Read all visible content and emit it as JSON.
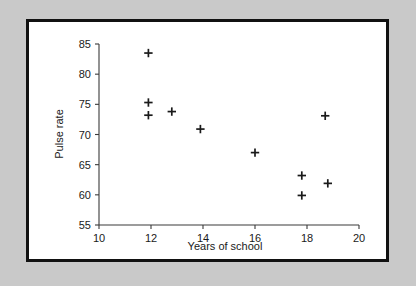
{
  "figure": {
    "background_color": "#c9c9c9",
    "card_color": "#ffffff",
    "frame_color": "#111111"
  },
  "chart_data": {
    "type": "scatter",
    "title": "",
    "xlabel": "Years of school",
    "ylabel": "Pulse rate",
    "xlim": [
      10,
      20
    ],
    "ylim": [
      55,
      85
    ],
    "xticks": [
      10,
      12,
      14,
      16,
      18,
      20
    ],
    "yticks": [
      55,
      60,
      65,
      70,
      75,
      80,
      85
    ],
    "xtick_labels": [
      "10",
      "12",
      "14",
      "16",
      "18",
      "20"
    ],
    "ytick_labels": [
      "55",
      "60",
      "65",
      "70",
      "75",
      "80",
      "85"
    ],
    "grid": false,
    "legend": false,
    "marker": "plus",
    "marker_color": "#1a1a1a",
    "points": [
      {
        "x": 11.9,
        "y": 83.5
      },
      {
        "x": 11.9,
        "y": 75.3
      },
      {
        "x": 11.9,
        "y": 73.2
      },
      {
        "x": 12.8,
        "y": 73.8
      },
      {
        "x": 13.9,
        "y": 70.9
      },
      {
        "x": 16.0,
        "y": 67.0
      },
      {
        "x": 17.8,
        "y": 63.2
      },
      {
        "x": 17.8,
        "y": 59.9
      },
      {
        "x": 18.7,
        "y": 73.1
      },
      {
        "x": 18.8,
        "y": 61.9
      }
    ]
  }
}
